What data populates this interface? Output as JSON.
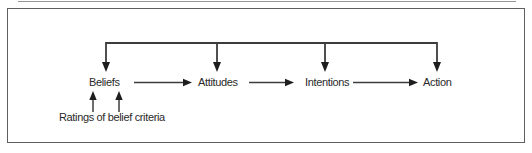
{
  "figure": {
    "nodes": [
      {
        "id": "beliefs",
        "label": "Beliefs"
      },
      {
        "id": "attitudes",
        "label": "Attitudes"
      },
      {
        "id": "intentions",
        "label": "Intentions"
      },
      {
        "id": "action",
        "label": "Action"
      }
    ],
    "input_label": "Ratings of belief criteria",
    "connections": {
      "forward": [
        {
          "from": "Beliefs",
          "to": "Attitudes"
        },
        {
          "from": "Attitudes",
          "to": "Intentions"
        },
        {
          "from": "Intentions",
          "to": "Action"
        }
      ],
      "feedback_line_targets": [
        "Beliefs",
        "Attitudes",
        "Intentions",
        "Action"
      ],
      "input": {
        "from": "Ratings of belief criteria",
        "to": "Beliefs"
      }
    },
    "colors": {
      "line": "#3c3c3c",
      "arrowhead": "#1e1e1e",
      "text": "#2a2a2a",
      "frame_border": "#5f5f5f",
      "top_rule": "#979797",
      "background": "#ffffff"
    }
  }
}
